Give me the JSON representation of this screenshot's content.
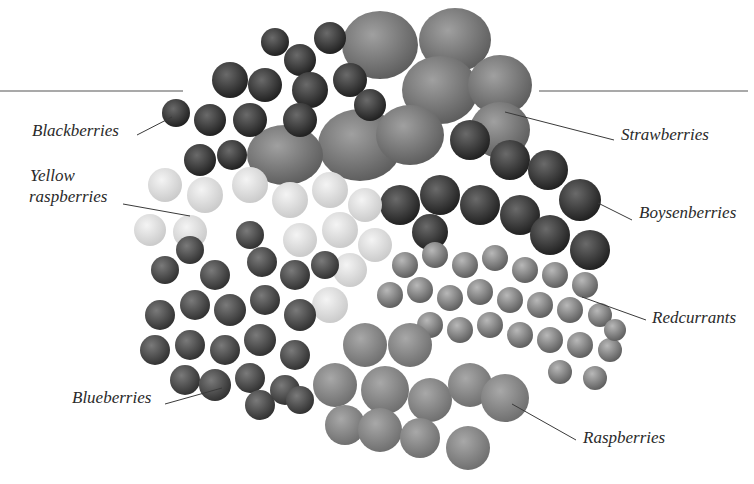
{
  "figure": {
    "type": "labeled-photograph",
    "colors": {
      "background": "#ffffff",
      "text": "#2a2a2a",
      "leader": "#3a3a3a"
    },
    "labels": [
      {
        "id": "blackberries",
        "text": "Blackberries"
      },
      {
        "id": "yellow-raspberries",
        "line1": "Yellow",
        "line2": "raspberries"
      },
      {
        "id": "blueberries",
        "text": "Blueberries"
      },
      {
        "id": "strawberries",
        "text": "Strawberries"
      },
      {
        "id": "boysenberries",
        "text": "Boysenberries"
      },
      {
        "id": "redcurrants",
        "text": "Redcurrants"
      },
      {
        "id": "raspberries",
        "text": "Raspberries"
      }
    ]
  }
}
